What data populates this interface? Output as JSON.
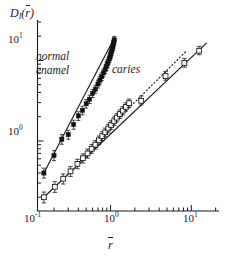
{
  "figure": {
    "background": "#ffffff",
    "ink": "#1a1a1a"
  },
  "axes": {
    "y_label_main": "D",
    "y_label_sub": "I",
    "y_label_arg_open": "(",
    "y_label_arg": "r",
    "y_label_arg_close": ")",
    "x_label": "r",
    "x_ticks": [
      {
        "value": 0.1,
        "mantissa": "10",
        "exponent": "-1",
        "major": true
      },
      {
        "value": 1.0,
        "mantissa": "10",
        "exponent": "0",
        "major": true
      },
      {
        "value": 10.0,
        "mantissa": "10",
        "exponent": "1",
        "major": true
      }
    ],
    "y_ticks": [
      {
        "value": 1.0,
        "mantissa": "10",
        "exponent": "0",
        "major": true
      },
      {
        "value": 10.0,
        "mantissa": "10",
        "exponent": "1",
        "major": true
      }
    ],
    "x_range": [
      0.125,
      22.0
    ],
    "y_range": [
      0.135,
      30.0
    ],
    "scale": "log-log",
    "spines": [
      "left",
      "bottom"
    ],
    "grid": false
  },
  "annotations": [
    {
      "name": "normal-enamel-label",
      "line1": "normal",
      "line2": "enamel",
      "x_px": 36,
      "y_px": 56
    },
    {
      "name": "caries-label",
      "text": "caries",
      "x_px": 112,
      "y_px": 68
    }
  ],
  "chart_data": {
    "type": "scatter",
    "title": "",
    "xlabel": "r̄",
    "ylabel": "D_I(r̄)",
    "xscale": "log",
    "yscale": "log",
    "xlim": [
      0.125,
      22.0
    ],
    "ylim": [
      0.135,
      30.0
    ],
    "grid": false,
    "legend": "inline-annotations",
    "series": [
      {
        "name": "normal enamel",
        "marker": "filled-square",
        "marker_color": "#111111",
        "line": "solid",
        "fit_slope": 2.62,
        "points": [
          {
            "x": 0.15,
            "y": 0.4,
            "yerr_lo": 0.055,
            "yerr_hi": 0.06
          },
          {
            "x": 0.2,
            "y": 0.66,
            "yerr_lo": 0.09,
            "yerr_hi": 0.1
          },
          {
            "x": 0.25,
            "y": 1.05,
            "yerr_lo": 0.14,
            "yerr_hi": 0.15
          },
          {
            "x": 0.3,
            "y": 1.2,
            "yerr_lo": 0.15,
            "yerr_hi": 0.16
          },
          {
            "x": 0.35,
            "y": 1.6,
            "yerr_lo": 0.2,
            "yerr_hi": 0.21
          },
          {
            "x": 0.4,
            "y": 2.05,
            "yerr_lo": 0.25,
            "yerr_hi": 0.26
          },
          {
            "x": 0.45,
            "y": 2.4,
            "yerr_lo": 0.29,
            "yerr_hi": 0.3
          },
          {
            "x": 0.5,
            "y": 2.9,
            "yerr_lo": 0.34,
            "yerr_hi": 0.36
          },
          {
            "x": 0.55,
            "y": 3.3,
            "yerr_lo": 0.38,
            "yerr_hi": 0.4
          },
          {
            "x": 0.6,
            "y": 3.9,
            "yerr_lo": 0.44,
            "yerr_hi": 0.46
          },
          {
            "x": 0.65,
            "y": 4.4,
            "yerr_lo": 0.49,
            "yerr_hi": 0.51
          },
          {
            "x": 0.7,
            "y": 5.1,
            "yerr_lo": 0.56,
            "yerr_hi": 0.58
          },
          {
            "x": 0.74,
            "y": 5.7,
            "yerr_lo": 0.62,
            "yerr_hi": 0.64
          },
          {
            "x": 0.78,
            "y": 6.3,
            "yerr_lo": 0.68,
            "yerr_hi": 0.7
          },
          {
            "x": 0.82,
            "y": 7.0,
            "yerr_lo": 0.74,
            "yerr_hi": 0.77
          },
          {
            "x": 0.86,
            "y": 7.7,
            "yerr_lo": 0.81,
            "yerr_hi": 0.84
          },
          {
            "x": 0.89,
            "y": 8.4,
            "yerr_lo": 0.88,
            "yerr_hi": 0.91
          },
          {
            "x": 0.92,
            "y": 9.1,
            "yerr_lo": 0.95,
            "yerr_hi": 0.98
          },
          {
            "x": 0.945,
            "y": 9.8,
            "yerr_lo": 1.01,
            "yerr_hi": 1.05
          },
          {
            "x": 0.97,
            "y": 10.5,
            "yerr_lo": 1.08,
            "yerr_hi": 1.12
          },
          {
            "x": 0.99,
            "y": 11.3,
            "yerr_lo": 1.16,
            "yerr_hi": 1.2
          },
          {
            "x": 1.01,
            "y": 12.0,
            "yerr_lo": 1.23,
            "yerr_hi": 1.28
          },
          {
            "x": 1.03,
            "y": 12.9,
            "yerr_lo": 1.31,
            "yerr_hi": 1.36
          },
          {
            "x": 1.05,
            "y": 13.8,
            "yerr_lo": 1.4,
            "yerr_hi": 1.45
          },
          {
            "x": 1.07,
            "y": 14.8,
            "yerr_lo": 1.49,
            "yerr_hi": 1.55
          },
          {
            "x": 1.085,
            "y": 15.8,
            "yerr_lo": 1.59,
            "yerr_hi": 1.65
          },
          {
            "x": 1.1,
            "y": 16.9,
            "yerr_lo": 1.69,
            "yerr_hi": 1.76
          },
          {
            "x": 1.115,
            "y": 18.0,
            "yerr_lo": 1.8,
            "yerr_hi": 1.87
          }
        ],
        "fit_line": {
          "x1": 0.15,
          "y1": 0.4,
          "x2": 1.13,
          "y2": 19.5
        }
      },
      {
        "name": "caries",
        "marker": "open-square",
        "marker_color": "#ffffff",
        "marker_edge": "#111111",
        "line": "solid",
        "fit_slope": 1.55,
        "points": [
          {
            "x": 0.15,
            "y": 0.2,
            "yerr_lo": 0.03,
            "yerr_hi": 0.032
          },
          {
            "x": 0.205,
            "y": 0.27,
            "yerr_lo": 0.04,
            "yerr_hi": 0.042
          },
          {
            "x": 0.26,
            "y": 0.34,
            "yerr_lo": 0.048,
            "yerr_hi": 0.05
          },
          {
            "x": 0.32,
            "y": 0.42,
            "yerr_lo": 0.057,
            "yerr_hi": 0.06
          },
          {
            "x": 0.39,
            "y": 0.52,
            "yerr_lo": 0.068,
            "yerr_hi": 0.072
          },
          {
            "x": 0.455,
            "y": 0.61,
            "yerr_lo": 0.078,
            "yerr_hi": 0.082
          },
          {
            "x": 0.52,
            "y": 0.7,
            "yerr_lo": 0.088,
            "yerr_hi": 0.093
          },
          {
            "x": 0.585,
            "y": 0.8,
            "yerr_lo": 0.099,
            "yerr_hi": 0.105
          },
          {
            "x": 0.65,
            "y": 0.9,
            "yerr_lo": 0.11,
            "yerr_hi": 0.117
          },
          {
            "x": 0.72,
            "y": 1.02,
            "yerr_lo": 0.124,
            "yerr_hi": 0.132
          },
          {
            "x": 0.79,
            "y": 1.15,
            "yerr_lo": 0.139,
            "yerr_hi": 0.148
          },
          {
            "x": 0.86,
            "y": 1.28,
            "yerr_lo": 0.153,
            "yerr_hi": 0.164
          },
          {
            "x": 0.94,
            "y": 1.43,
            "yerr_lo": 0.17,
            "yerr_hi": 0.182
          },
          {
            "x": 1.02,
            "y": 1.58,
            "yerr_lo": 0.187,
            "yerr_hi": 0.2
          },
          {
            "x": 1.11,
            "y": 1.76,
            "yerr_lo": 0.207,
            "yerr_hi": 0.222
          },
          {
            "x": 1.2,
            "y": 1.95,
            "yerr_lo": 0.228,
            "yerr_hi": 0.245
          },
          {
            "x": 1.31,
            "y": 2.16,
            "yerr_lo": 0.251,
            "yerr_hi": 0.27
          },
          {
            "x": 1.42,
            "y": 2.38,
            "yerr_lo": 0.275,
            "yerr_hi": 0.296
          },
          {
            "x": 1.55,
            "y": 2.65,
            "yerr_lo": 0.305,
            "yerr_hi": 0.328
          },
          {
            "x": 1.7,
            "y": 2.95,
            "yerr_lo": 0.338,
            "yerr_hi": 0.364
          },
          {
            "x": 2.4,
            "y": 3.15,
            "yerr_lo": 0.36,
            "yerr_hi": 0.47
          },
          {
            "x": 4.8,
            "y": 6.4,
            "yerr_lo": 0.72,
            "yerr_hi": 0.9
          },
          {
            "x": 8.2,
            "y": 9.3,
            "yerr_lo": 1.05,
            "yerr_hi": 1.3
          },
          {
            "x": 12.5,
            "y": 13.2,
            "yerr_lo": 1.45,
            "yerr_hi": 1.75
          }
        ],
        "fit_line": {
          "x1": 0.15,
          "y1": 0.2,
          "x2": 15.5,
          "y2": 16.5
        }
      }
    ],
    "reference_lines": [
      {
        "name": "caries-dotted-guide",
        "style": "dotted",
        "x1": 1.55,
        "y1": 2.35,
        "x2": 8.5,
        "y2": 12.8
      }
    ]
  }
}
